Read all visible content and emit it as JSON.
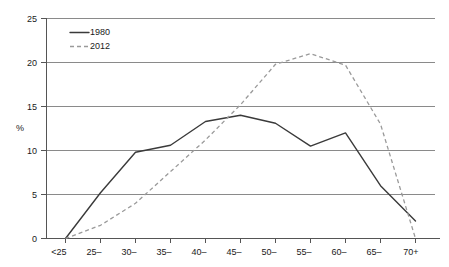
{
  "chart_data": {
    "type": "line",
    "title": "",
    "xlabel": "",
    "ylabel": "%",
    "ylim": [
      0,
      25
    ],
    "yticks": [
      0,
      5,
      10,
      15,
      20,
      25
    ],
    "ytick_labels": [
      "0",
      "5",
      "10",
      "15",
      "20",
      "25"
    ],
    "categories": [
      "<25",
      "25–",
      "30–",
      "35–",
      "40–",
      "45–",
      "50–",
      "55–",
      "60–",
      "65–",
      "70+"
    ],
    "grid": true,
    "legend_position": "top-left",
    "series": [
      {
        "name": "1980",
        "style": "solid",
        "color": "#3a3a3a",
        "values": [
          0,
          5.2,
          9.8,
          10.6,
          13.3,
          14.0,
          13.1,
          10.5,
          12.0,
          6.0,
          2.0
        ]
      },
      {
        "name": "2012",
        "style": "dashed",
        "color": "#9a9a9a",
        "values": [
          0,
          1.5,
          4.0,
          7.6,
          11.2,
          15.2,
          19.8,
          21.0,
          19.7,
          13.0,
          0.0
        ]
      }
    ]
  },
  "legend": {
    "entries": [
      {
        "label": "1980"
      },
      {
        "label": "2012"
      }
    ]
  },
  "axes": {
    "y_axis_title": "%"
  }
}
